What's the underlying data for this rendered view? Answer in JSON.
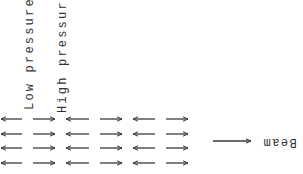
{
  "diagram": {
    "labels": {
      "low_pressure": "Low pressure",
      "high_pressure": "High pressure",
      "beam": "Beam"
    },
    "arrow_grid": {
      "rows": 4,
      "columns": 6,
      "column_directions": [
        "left",
        "right",
        "left",
        "right",
        "left",
        "right"
      ]
    },
    "beam_arrow_direction": "right",
    "colors": {
      "stroke": "#3a3a3a",
      "background": "#ffffff"
    }
  }
}
